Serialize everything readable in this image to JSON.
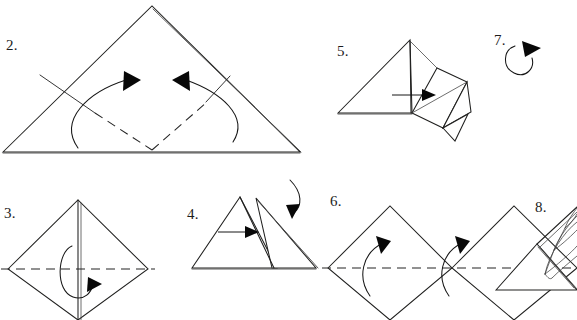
{
  "document": {
    "kind": "origami-instruction-diagram",
    "title": "",
    "background_color": "#ffffff",
    "ink_color": "#1c1c1c",
    "width": 577,
    "height": 320
  },
  "steps": [
    {
      "id": "step-2",
      "label": "2.",
      "label_x": 6,
      "label_y": 50,
      "caption": "",
      "shape": "large triangle with dashed V valley folds and two inward curved arrows",
      "arrows": 2,
      "dashed_folds": 2
    },
    {
      "id": "step-3",
      "label": "3.",
      "label_x": 4,
      "label_y": 218,
      "caption": "",
      "shape": "diamond with vertical centre crease, horizontal dashed fold and hooked fold-behind arrow",
      "arrows": 1,
      "dashed_folds": 1
    },
    {
      "id": "step-4",
      "label": "4.",
      "label_x": 187,
      "label_y": 219,
      "caption": "",
      "shape": "two overlapping triangles, straight push arrow and curved fold-over arrow",
      "arrows": 2,
      "dashed_folds": 0
    },
    {
      "id": "step-5",
      "label": "5.",
      "label_x": 337,
      "label_y": 56,
      "caption": "",
      "shape": "triangle with opened squash-fold flap at right and horizontal arrow",
      "arrows": 1,
      "dashed_folds": 0
    },
    {
      "id": "step-6",
      "label": "6.",
      "label_x": 330,
      "label_y": 206,
      "caption": "",
      "shape": "two adjacent diamonds with horizontal dashed fold and two upward curved arrows",
      "arrows": 2,
      "dashed_folds": 1
    },
    {
      "id": "step-7",
      "label": "7.",
      "label_x": 494,
      "label_y": 45,
      "caption": "",
      "shape": "triangle with raised diagonal flap and circular rotate arrow",
      "arrows": 1,
      "dashed_folds": 0
    },
    {
      "id": "step-8",
      "label": "8.",
      "label_x": 535,
      "label_y": 212,
      "caption": "",
      "shape": "fanned curved petals emerging from the corner",
      "arrows": 0,
      "dashed_folds": 0
    }
  ],
  "geometry": {
    "step2": {
      "triangle": "M3,152 L152,6 L300,152 Z",
      "edge_doubled": "M152,8 L301,152",
      "crease_left": "M40,75 L95,113",
      "crease_right": "M206,102 L228,76",
      "dash_left": "M95,113 L152,150",
      "dash_right": "M152,150 L206,102",
      "arrow_left_path": "M78,148 C60,120 88,92 126,80",
      "arrow_left_head": "124,72 140,81 124,90",
      "arrow_right_path": "M232,142 C248,118 220,92 186,80",
      "arrow_right_head": "188,72 172,81 188,90"
    },
    "step3": {
      "diamond": "M8,269 L78,200 L148,269 L78,320 Z",
      "center_line": "M78,200 L78,320",
      "center_line_double": "M81,202 L81,320",
      "dash_fold": "M2,269 L154,269",
      "hook_path": "M72,248 C58,252 56,290 72,296 C84,300 90,292 92,286",
      "hook_head": "88,278 101,284 88,291"
    },
    "step4": {
      "tri_left": "M192,268 L240,197 L277,268 Z",
      "tri_right": "M272,268 L255,198 L316,268 Z",
      "tri_right_edge": "M256,200 L318,268",
      "inner_crease": "M240,197 L275,268",
      "arrow_line": "M218,232 L247,232",
      "arrow_head": "245,226 258,232 245,238",
      "curve_path": "M296,182 C303,196 301,208 293,214",
      "curve_head": "287,206 296,222 298,206"
    },
    "step5": {
      "tri_main": "M338,113 L410,40 L412,113 Z",
      "tri_edge_soft": "M338,113 L411,113",
      "vertical": "M410,42 L411,113",
      "flap_outline": "M412,113 L436,69 L466,82 L443,128 Z",
      "flap_tab_upper": "M436,69 L468,83",
      "flap_tab_right": "M466,82 L470,112 L443,128",
      "flap_tab_lower": "M443,128 L454,140 L466,112",
      "flap_diag": "M412,113 L466,82",
      "flap_inner": "M412,113 L443,128",
      "arrow_line": "M394,95 L424,95",
      "arrow_head": "422,89 435,95 422,101"
    },
    "step6": {
      "diamond_left": "M328,268 L390,206 L452,268 L390,320 Z",
      "diamond_right": "M452,268 L452,268 L452,268 Z",
      "diamond_right_poly": "M452,268 L452,268 L452,268 Z",
      "diamond_b": "M452,268 L514,206 L577,268 L514,320 Z",
      "dash_fold": "M322,268 L577,268",
      "arrow_left_path": "M370,296 C358,278 362,254 382,243",
      "arrow_left_head": "376,236 390,240 382,253",
      "arrow_right_path": "M448,296 C436,278 440,254 460,243",
      "arrow_right_head": "454,236 468,240 460,253"
    },
    "step7": {
      "triangle": "M496,290 L537,244 L577,290 Z",
      "flap_diag": "M537,244 L577,208",
      "flap_diag2": "M539,247 L577,212",
      "inner_crease": "M538,246 L573,288",
      "inner_crease2": "M540,247 L576,289",
      "rotate_path": "M516,46 C505,48 503,66 514,72 C525,78 534,68 532,58",
      "rotate_head": "524,42 540,48 526,56"
    },
    "step8": {
      "petal_1": "M548,280 C556,256 572,234 577,228",
      "petal_2": "M548,280 C560,262 574,248 577,244",
      "petal_outer": "M548,280 C552,262 566,240 577,230",
      "petal_a": "M552,248 C560,232 572,220 577,216",
      "petal_b": "M558,236 C566,224 574,214 577,210",
      "petal_c": "M566,222 C570,214 575,206 577,204",
      "fan_joint_1": "M552,248 L560,252",
      "fan_joint_2": "M560,235 L568,240",
      "fan_joint_3": "M567,222 L575,228"
    }
  }
}
